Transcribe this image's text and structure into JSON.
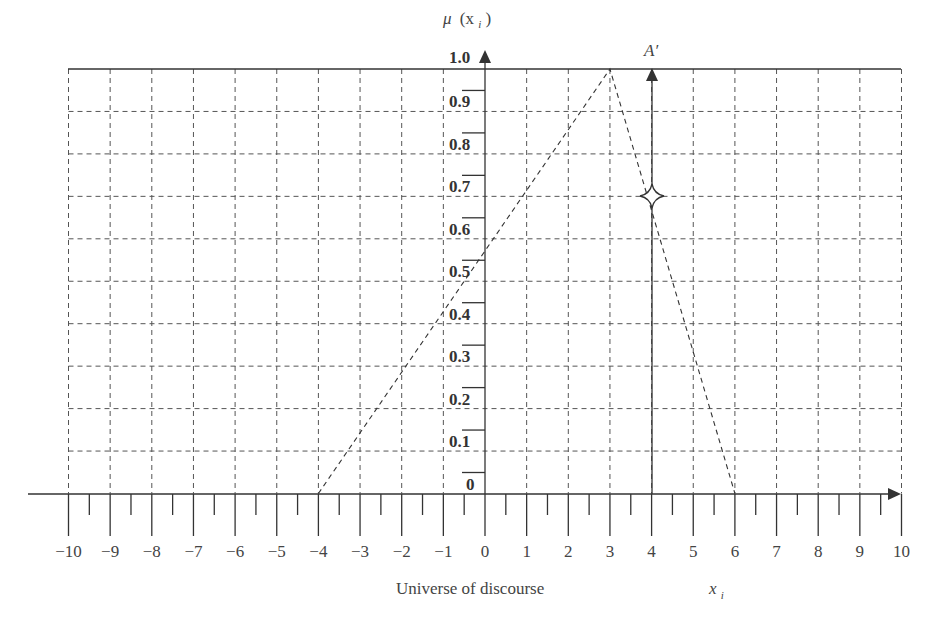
{
  "chart_data": {
    "type": "line",
    "title": "",
    "xlabel": "Universe of discourse",
    "xlabel_var": "x_i",
    "ylabel": "μ (x_i)",
    "xlim": [
      -10,
      10
    ],
    "ylim": [
      0,
      1.0
    ],
    "grid": true,
    "x_ticks": [
      "-10",
      "-9",
      "-8",
      "-7",
      "-6",
      "-5",
      "-4",
      "-3",
      "-2",
      "-1",
      "0",
      "1",
      "2",
      "3",
      "4",
      "5",
      "6",
      "7",
      "8",
      "9",
      "10"
    ],
    "y_ticks": [
      "0",
      "0.1",
      "0.2",
      "0.3",
      "0.4",
      "0.5",
      "0.6",
      "0.7",
      "0.8",
      "0.9",
      "1.0"
    ],
    "series": [
      {
        "name": "triangular membership function",
        "style": "dashed",
        "x": [
          -4,
          3,
          6
        ],
        "y": [
          0,
          1.0,
          0
        ]
      }
    ],
    "annotations": [
      {
        "label": "A′",
        "type": "vertical arrow",
        "x": 4,
        "y_from": 0,
        "y_to": 1.0
      },
      {
        "type": "star marker",
        "x": 4,
        "y": 0.67
      }
    ]
  },
  "labels": {
    "y_axis_label_mu": "μ",
    "y_axis_label_open": "(x",
    "y_axis_label_sub": "i",
    "y_axis_label_close": ")",
    "x_caption": "Universe of discourse",
    "x_var": "x",
    "x_var_sub": "i",
    "a_prime": "A′",
    "y_ticks": [
      "0",
      "0.1",
      "0.2",
      "0.3",
      "0.4",
      "0.5",
      "0.6",
      "0.7",
      "0.8",
      "0.9",
      "1.0"
    ],
    "x_ticks": [
      "−10",
      "−9",
      "−8",
      "−7",
      "−6",
      "−5",
      "−4",
      "−3",
      "−2",
      "−1",
      "0",
      "1",
      "2",
      "3",
      "4",
      "5",
      "6",
      "7",
      "8",
      "9",
      "10"
    ]
  }
}
